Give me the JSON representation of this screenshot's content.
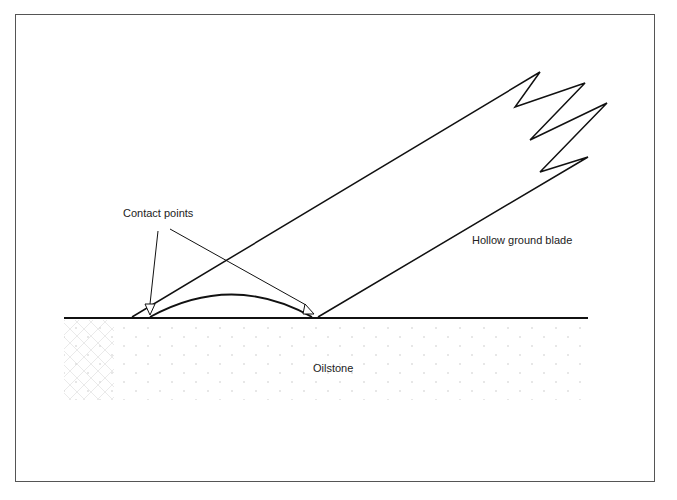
{
  "diagram": {
    "labels": {
      "contact_points": "Contact points",
      "blade": "Hollow ground blade",
      "stone": "Oilstone"
    },
    "colors": {
      "line": "#111111",
      "frame": "#555555",
      "stipple": "#c8c8c8"
    }
  }
}
